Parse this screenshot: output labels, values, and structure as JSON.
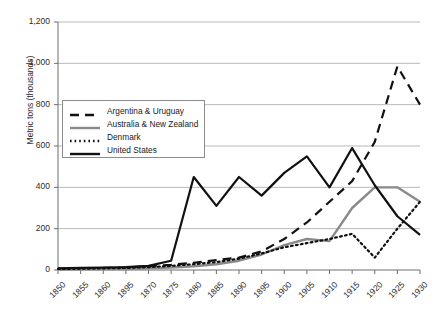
{
  "chart_data": {
    "type": "line",
    "title": "",
    "xlabel": "",
    "ylabel": "Metric tons (thousands)",
    "ylim": [
      0,
      1200
    ],
    "ytick_labels": [
      "0",
      "200",
      "400",
      "600",
      "800",
      "1,000",
      "1,200"
    ],
    "ytick_values": [
      0,
      200,
      400,
      600,
      800,
      1000,
      1200
    ],
    "grid": "horizontal",
    "legend_position": "upper-left-inside",
    "categories": [
      "1850",
      "1855",
      "1860",
      "1895",
      "1870",
      "1875",
      "1880",
      "1885",
      "1890",
      "1895",
      "1900",
      "1905",
      "1910",
      "1915",
      "1920",
      "1925",
      "1930"
    ],
    "x": [
      1850,
      1855,
      1860,
      1865,
      1870,
      1875,
      1880,
      1885,
      1890,
      1895,
      1900,
      1905,
      1910,
      1915,
      1920,
      1925,
      1930
    ],
    "series": [
      {
        "name": "Argentina & Uruguay",
        "style": "dashed",
        "color": "#111111",
        "values": [
          5,
          8,
          10,
          12,
          18,
          25,
          35,
          48,
          60,
          90,
          150,
          230,
          330,
          430,
          620,
          985,
          800
        ]
      },
      {
        "name": "Australia & New Zealand",
        "style": "solid-gray",
        "color": "#8a8a8a",
        "values": [
          2,
          3,
          4,
          5,
          8,
          12,
          18,
          28,
          45,
          75,
          120,
          150,
          140,
          300,
          400,
          400,
          330
        ]
      },
      {
        "name": "Denmark",
        "style": "dotted",
        "color": "#111111",
        "values": [
          5,
          6,
          8,
          10,
          14,
          20,
          28,
          38,
          55,
          80,
          110,
          130,
          150,
          175,
          60,
          200,
          330
        ]
      },
      {
        "name": "United States",
        "style": "solid-black",
        "color": "#111111",
        "values": [
          8,
          10,
          12,
          14,
          20,
          45,
          450,
          310,
          450,
          360,
          470,
          550,
          400,
          590,
          410,
          260,
          170
        ]
      }
    ]
  },
  "legend": {
    "items": [
      {
        "label": "Argentina & Uruguay"
      },
      {
        "label": "Australia & New Zealand"
      },
      {
        "label": "Denmark"
      },
      {
        "label": "United States"
      }
    ]
  }
}
